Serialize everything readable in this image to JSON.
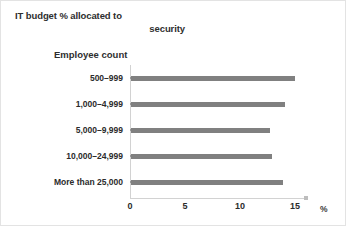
{
  "chart_data": {
    "type": "bar",
    "orientation": "horizontal",
    "title": "IT budget %  allocated to security",
    "title_line1": "IT budget %  allocated to",
    "title_line2": "security",
    "xlabel": "%",
    "ylabel": "Employee count",
    "categories": [
      "500–999",
      "1,000–4,999",
      "5,000–9,999",
      "10,000–24,999",
      "More than 25,000"
    ],
    "values": [
      14.9,
      14.0,
      12.6,
      12.8,
      13.8
    ],
    "xticks": [
      "0",
      "5",
      "10",
      "15"
    ],
    "xtick_values": [
      0,
      5,
      10,
      15
    ],
    "xlim": [
      0,
      16
    ],
    "grid": false,
    "legend": false,
    "bar_color": "#808080",
    "axis_color": "#d2d2d2",
    "text_color": "#2b2b2b"
  }
}
